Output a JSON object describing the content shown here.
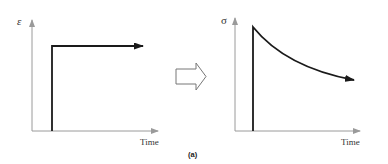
{
  "figure": {
    "caption": "(a)",
    "left_plot": {
      "y_label": "ε",
      "x_label": "Time",
      "curve": "step"
    },
    "right_plot": {
      "y_label": "σ",
      "x_label": "Time",
      "curve": "decay"
    },
    "transition_icon": "hollow-right-arrow-icon",
    "colors": {
      "axis": "#9a9a9a",
      "curve": "#1a1a1a",
      "arrow_outline": "#777777"
    }
  }
}
